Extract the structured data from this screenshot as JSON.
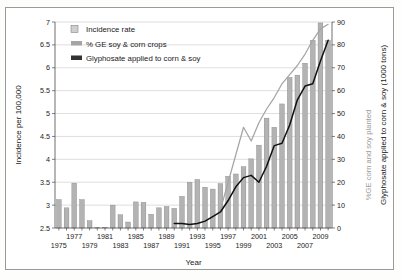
{
  "chart_data": {
    "type": "bar",
    "title": "",
    "xlabel": "Year",
    "ylabel": "Incidence per 100,000",
    "ylabel_right_primary": "Glyphosate applied to corn & soy (1000 tons)",
    "ylabel_right_secondary": "%GE corn and soy planted",
    "ylim": [
      2.5,
      7
    ],
    "ylim_right": [
      0,
      90
    ],
    "xlim": [
      1975,
      2010
    ],
    "grid": true,
    "legend_position": "top-left",
    "yticks": [
      "2.5",
      "3",
      "3.5",
      "4",
      "4.5",
      "5",
      "5.5",
      "6",
      "6.5",
      "7"
    ],
    "ytick_values": [
      2.5,
      3,
      3.5,
      4,
      4.5,
      5,
      5.5,
      6,
      6.5,
      7
    ],
    "yticks_right": [
      "0",
      "10",
      "20",
      "30",
      "40",
      "50",
      "60",
      "70",
      "80",
      "90"
    ],
    "ytick_values_right": [
      0,
      10,
      20,
      30,
      40,
      50,
      60,
      70,
      80,
      90
    ],
    "xticks_row1": [
      "1977",
      "1981",
      "1985",
      "1989",
      "1993",
      "1997",
      "2001",
      "2005",
      "2009"
    ],
    "xticks_row2": [
      "1975",
      "1979",
      "1983",
      "1987",
      "1991",
      "1995",
      "1999",
      "2003",
      "2007"
    ],
    "categories": [
      1975,
      1976,
      1977,
      1978,
      1979,
      1980,
      1981,
      1982,
      1983,
      1984,
      1985,
      1986,
      1987,
      1988,
      1989,
      1990,
      1991,
      1992,
      1993,
      1994,
      1995,
      1996,
      1997,
      1998,
      1999,
      2000,
      2001,
      2002,
      2003,
      2004,
      2005,
      2006,
      2007,
      2008,
      2009,
      2010
    ],
    "colors": {
      "bar": "#b3b3b3",
      "bar_edge": "#7d7d7d",
      "ge_line": "#a5a5a5",
      "glyphosate_line": "#111111",
      "grid": "#c8c8c8",
      "axis": "#4a4a4a",
      "frame": "#9a9a9a"
    },
    "series": [
      {
        "name": "Incidence rate",
        "type": "bar",
        "axis": "left",
        "units": "per 100,000",
        "values": [
          3.12,
          2.94,
          3.48,
          3.12,
          2.66,
          2.5,
          2.51,
          3.0,
          2.79,
          2.63,
          3.07,
          3.06,
          2.8,
          2.94,
          2.97,
          2.93,
          3.19,
          3.5,
          3.56,
          3.39,
          3.35,
          3.47,
          3.63,
          3.68,
          3.84,
          4.01,
          4.31,
          4.9,
          4.7,
          5.21,
          5.79,
          5.84,
          6.1,
          6.6,
          6.98,
          6.6
        ]
      },
      {
        "name": "% GE soy & corn crops",
        "type": "line",
        "axis": "right",
        "units": "percent planted",
        "x": [
          1996,
          1997,
          1998,
          1999,
          2000,
          2001,
          2002,
          2003,
          2004,
          2005,
          2006,
          2007,
          2008,
          2009,
          2010
        ],
        "values": [
          8,
          20,
          32,
          44,
          38,
          46,
          52,
          57,
          63,
          67,
          71,
          76,
          82,
          87,
          89
        ]
      },
      {
        "name": "Glyphosate applied to corn & soy",
        "type": "line",
        "axis": "right",
        "units": "1000 tons",
        "x": [
          1990,
          1991,
          1992,
          1993,
          1994,
          1995,
          1996,
          1997,
          1998,
          1999,
          2000,
          2001,
          2002,
          2003,
          2004,
          2005,
          2006,
          2007,
          2008,
          2009,
          2010
        ],
        "values": [
          2,
          2,
          1.5,
          2,
          3,
          5,
          7,
          12,
          18,
          22,
          23,
          20,
          27,
          36,
          37,
          45,
          56,
          62,
          63,
          73,
          82
        ]
      }
    ],
    "legend": [
      {
        "label": "Incidence rate",
        "swatch": "bar-swatch",
        "color": "#b3b3b3"
      },
      {
        "label": "% GE soy & corn crops",
        "swatch": "line-swatch-gray",
        "color": "#a5a5a5"
      },
      {
        "label": "Glyphosate applied to corn & soy",
        "swatch": "line-swatch-black",
        "color": "#333333"
      }
    ]
  }
}
